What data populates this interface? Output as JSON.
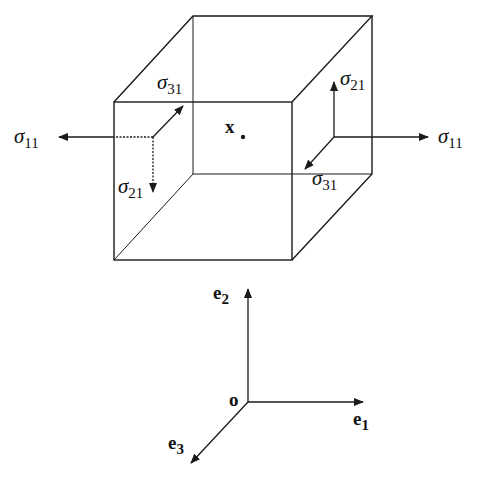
{
  "diagram": {
    "type": "stress-cube",
    "point_label": "x",
    "left_face": {
      "normal_stress": {
        "symbol": "σ",
        "sub": "11"
      },
      "shear_up": {
        "symbol": "σ",
        "sub": "31"
      },
      "shear_down": {
        "symbol": "σ",
        "sub": "21"
      }
    },
    "right_face": {
      "normal_stress": {
        "symbol": "σ",
        "sub": "11"
      },
      "shear_up": {
        "symbol": "σ",
        "sub": "21"
      },
      "shear_down": {
        "symbol": "σ",
        "sub": "31"
      }
    },
    "axes": {
      "origin": "o",
      "e1": {
        "symbol": "e",
        "sub": "1"
      },
      "e2": {
        "symbol": "e",
        "sub": "2"
      },
      "e3": {
        "symbol": "e",
        "sub": "3"
      }
    },
    "colors": {
      "stroke": "#1a1a1a",
      "background": "#ffffff"
    }
  }
}
